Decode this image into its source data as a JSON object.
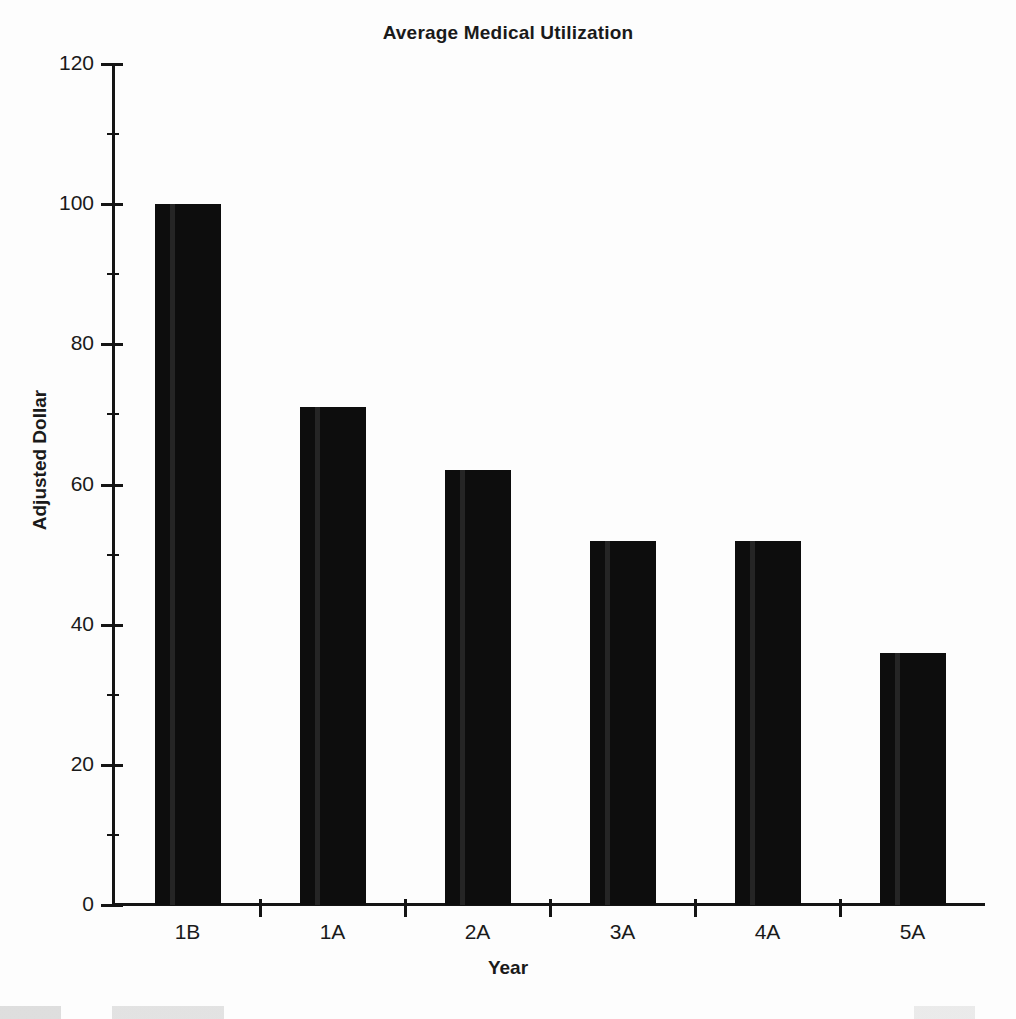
{
  "chart_data": {
    "type": "bar",
    "title": "Average Medical Utilization",
    "xlabel": "Year",
    "ylabel": "Adjusted Dollar",
    "categories": [
      "1B",
      "1A",
      "2A",
      "3A",
      "4A",
      "5A"
    ],
    "values": [
      100,
      71,
      62,
      52,
      52,
      36
    ],
    "series": [
      {
        "name": "Adjusted Dollar",
        "values": [
          100,
          71,
          62,
          52,
          52,
          36
        ]
      }
    ],
    "ylim": [
      0,
      120
    ],
    "xlim_categories": 6,
    "y_major_ticks": [
      0,
      20,
      40,
      60,
      80,
      100,
      120
    ],
    "y_tick_labels": [
      "0",
      "20",
      "40",
      "60",
      "80",
      "100",
      "120"
    ],
    "y_minor_ticks": [
      10,
      30,
      50,
      70,
      90,
      110
    ],
    "grid": false,
    "legend": null,
    "legend_position": "none",
    "bar_color": "#0d0d0d",
    "axis_color": "#141414",
    "background_color": "#fdfdfd",
    "annotations": []
  },
  "figure": {
    "title": "Average Medical Utilization",
    "x_axis_title": "Year",
    "y_axis_title": "Adjusted Dollar"
  }
}
